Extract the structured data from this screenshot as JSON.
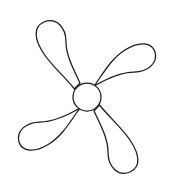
{
  "figure": {
    "kind": "line-drawing",
    "background_color": "#ffffff",
    "stroke_color": "#1a1a1a",
    "fill_color": "#ffffff",
    "stroke_width": 1.25,
    "canvas": {
      "width": 175,
      "height": 190,
      "viewbox": "0 0 175 190"
    }
  },
  "hub": {
    "label": "center hub",
    "cx": 87,
    "cy": 97,
    "r": 14,
    "fill": "#ffffff",
    "stroke": "#1a1a1a"
  },
  "blades": [
    {
      "label": "blade-upper-left",
      "tip": {
        "x": 36,
        "y": 33
      },
      "sweep": "counterclockwise",
      "path": "M 74.5 89.0 C 64 76 52 66 44 54 C 34 39 33 27 44 22 C 56 17 66 27 66 42 C 66 56 74 70 80 83 Z"
    },
    {
      "label": "blade-upper-right",
      "tip": {
        "x": 150,
        "y": 40
      },
      "sweep": "counterclockwise",
      "path": "M 95.5 84.0 C 104 72 112 58 125 50 C 139 41 152 42 155 52 C 158 63 148 72 134 72 C 120 72 106 79 94 86 Z"
    },
    {
      "label": "blade-lower-right",
      "tip": {
        "x": 139,
        "y": 157
      },
      "sweep": "counterclockwise",
      "path": "M 99.5 105.0 C 110 118 122 128 130 140 C 140 155 141 167 130 172 C 118 177 108 167 108 152 C 108 138 100 124 94 111 Z"
    },
    {
      "label": "blade-lower-left",
      "tip": {
        "x": 24,
        "y": 152
      },
      "sweep": "counterclockwise",
      "path": "M 78.5 110.0 C 70 122 62 136 49 144 C 35 153 22 152 19 142 C 16 131 26 122 40 122 C 54 122 68 115 80 108 Z"
    }
  ]
}
